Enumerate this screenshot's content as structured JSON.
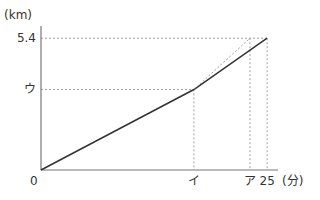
{
  "chart_data": {
    "type": "line",
    "title": "",
    "xlabel": "(分)",
    "ylabel": "(km)",
    "origin_label": "0",
    "x_ticks": [
      {
        "label": "イ",
        "value": 16.9
      },
      {
        "label": "ア",
        "value": 23.1
      },
      {
        "label": "25",
        "value": 25
      }
    ],
    "y_ticks": [
      {
        "label": "ウ",
        "value": 3.3
      },
      {
        "label": "5.4",
        "value": 5.4
      }
    ],
    "xlim": [
      0,
      26.2
    ],
    "ylim": [
      0,
      5.9
    ],
    "series": [
      {
        "name": "actual",
        "style": "solid",
        "points": [
          [
            0,
            0
          ],
          [
            16.9,
            3.3
          ],
          [
            25,
            5.4
          ]
        ]
      },
      {
        "name": "extension",
        "style": "dashed",
        "points": [
          [
            16.9,
            3.3
          ],
          [
            23.1,
            5.4
          ]
        ]
      }
    ],
    "grid": false
  }
}
